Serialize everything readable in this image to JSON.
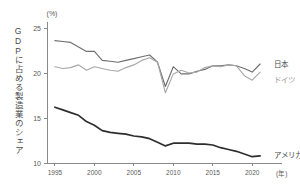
{
  "chart_data": {
    "type": "line",
    "title": "",
    "ylabel": "GDPに占める製造業のシェア",
    "yunit": "(%)",
    "xlabel": "(年)",
    "xlim": [
      1994,
      2022
    ],
    "ylim": [
      10,
      25
    ],
    "yticks": [
      10,
      15,
      20,
      25
    ],
    "ytick_labels": [
      "10",
      "15",
      "20",
      "25"
    ],
    "xticks": [
      1995,
      2000,
      2005,
      2010,
      2015,
      2020
    ],
    "xtick_labels": [
      "1995",
      "2000",
      "2005",
      "2010",
      "2015",
      "2020"
    ],
    "grid": false,
    "legend_position": "right-inline",
    "x": [
      1995,
      1996,
      1997,
      1998,
      1999,
      2000,
      2001,
      2002,
      2003,
      2004,
      2005,
      2006,
      2007,
      2008,
      2009,
      2010,
      2011,
      2012,
      2013,
      2014,
      2015,
      2016,
      2017,
      2018,
      2019,
      2020,
      2021
    ],
    "series": [
      {
        "name": "日本",
        "color": "#6f6f6f",
        "values": [
          23.6,
          23.5,
          23.4,
          22.9,
          22.4,
          22.4,
          21.4,
          21.3,
          21.2,
          21.4,
          21.6,
          21.8,
          22.0,
          21.2,
          18.5,
          20.7,
          19.9,
          19.9,
          20.2,
          20.4,
          20.8,
          20.8,
          20.9,
          20.8,
          20.5,
          20.1,
          21.0
        ]
      },
      {
        "name": "ドイツ",
        "color": "#a8a8a8",
        "values": [
          20.7,
          20.5,
          20.6,
          20.9,
          20.3,
          20.7,
          20.5,
          20.3,
          20.2,
          20.6,
          20.9,
          21.4,
          21.7,
          21.2,
          17.8,
          19.9,
          20.3,
          20.0,
          20.1,
          20.6,
          20.8,
          20.7,
          20.9,
          20.8,
          19.7,
          19.2,
          20.1
        ]
      },
      {
        "name": "アメリカ",
        "color": "#2e2e2e",
        "values": [
          16.2,
          15.9,
          15.6,
          15.3,
          14.6,
          14.2,
          13.6,
          13.4,
          13.3,
          13.2,
          13.0,
          12.9,
          12.7,
          12.3,
          11.9,
          12.2,
          12.2,
          12.2,
          12.1,
          12.1,
          12.0,
          11.7,
          11.5,
          11.3,
          11.0,
          10.7,
          10.8
        ]
      }
    ],
    "annotations": []
  }
}
